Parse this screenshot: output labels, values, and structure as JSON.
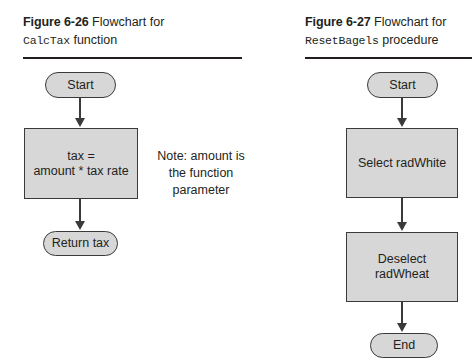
{
  "figures": [
    {
      "id": "figure-6-26",
      "caption": {
        "number": "Figure 6-26",
        "description": "Flowchart for",
        "subject_code": "CalcTax",
        "subject_suffix": "function"
      },
      "nodes": [
        {
          "name": "start",
          "type": "terminator",
          "label": "Start"
        },
        {
          "name": "process-tax",
          "type": "process",
          "label": "tax =\namount * tax rate"
        },
        {
          "name": "return-tax",
          "type": "terminator",
          "label": "Return tax"
        }
      ],
      "note": "Note: amount is the function parameter"
    },
    {
      "id": "figure-6-27",
      "caption": {
        "number": "Figure 6-27",
        "description": "Flowchart for",
        "subject_code": "ResetBagels",
        "subject_suffix": "procedure"
      },
      "nodes": [
        {
          "name": "start",
          "type": "terminator",
          "label": "Start"
        },
        {
          "name": "select-radwhite",
          "type": "process",
          "label": "Select radWhite"
        },
        {
          "name": "deselect-radwheat",
          "type": "process",
          "label": "Deselect radWheat"
        },
        {
          "name": "end",
          "type": "terminator",
          "label": "End"
        }
      ]
    }
  ],
  "colors": {
    "shape_fill": "#d7d7d7",
    "shape_stroke": "#3a3a3a",
    "text": "#231f20",
    "rule": "#231f20",
    "page_background": "#ffffff"
  }
}
